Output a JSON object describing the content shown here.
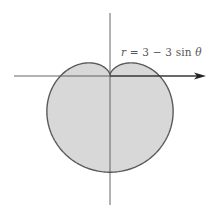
{
  "chart_data": {
    "type": "line",
    "subtype": "polar-curve",
    "title": "",
    "equation": "r = 3 − 3 sin θ",
    "equation_parts": {
      "lhs": "r",
      "eq": " = 3 − 3 sin ",
      "theta": "θ"
    },
    "curve": {
      "a": 3,
      "b": -3,
      "function": "sin",
      "theta_range": [
        0,
        6.283185307
      ],
      "samples": 360
    },
    "curve_name": "cardioid",
    "filled": true,
    "extent": {
      "x": [
        -3.9,
        3.9
      ],
      "y": [
        -6,
        0.75
      ]
    },
    "key_points": [
      {
        "theta_deg": 90,
        "r": 0,
        "label": "cusp at pole"
      },
      {
        "theta_deg": 0,
        "r": 3
      },
      {
        "theta_deg": 180,
        "r": 3
      },
      {
        "theta_deg": 270,
        "r": 6
      }
    ],
    "xlabel": "",
    "ylabel": "",
    "grid": false,
    "legend": null
  },
  "style": {
    "fill_color": "#d8d8d8",
    "stroke_color": "#5a5a5a",
    "axis_color": "#555555",
    "arrow_color": "#222222"
  },
  "layout": {
    "origin_px": [
      110,
      75
    ],
    "scale_px_per_unit": 16.2,
    "h_axis": {
      "x1": 14,
      "x2": 200,
      "y": 76
    },
    "v_axis": {
      "x": 110,
      "y1": 13,
      "y2": 205
    },
    "arrow_tip_x": 206
  }
}
